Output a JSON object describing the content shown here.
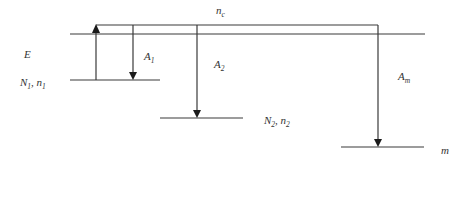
{
  "diagram": {
    "type": "energy-level-diagram",
    "labels": {
      "continuum": {
        "main": "n",
        "sub": "c"
      },
      "energy": "E",
      "level1": {
        "N": "N",
        "Nsub": "1",
        "sep": ", ",
        "n": "n",
        "nsub": "1"
      },
      "level2": {
        "N": "N",
        "Nsub": "2",
        "sep": ", ",
        "n": "n",
        "nsub": "2"
      },
      "levelm": "m",
      "A1": {
        "main": "A",
        "sub": "1"
      },
      "A2": {
        "main": "A",
        "sub": "2"
      },
      "Am": {
        "main": "A",
        "sub": "m"
      }
    },
    "colors": {
      "line": "#3a3a3a",
      "text": "#333333",
      "background": "#ffffff"
    }
  }
}
